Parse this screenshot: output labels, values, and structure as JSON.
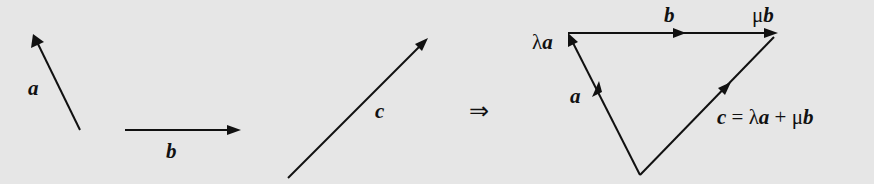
{
  "diagram": {
    "labels": {
      "a": "a",
      "b": "b",
      "c": "c",
      "implies": "⇒",
      "tri_a": "a",
      "tri_b": "b",
      "lambda_a_prefix": "λ",
      "lambda_a_var": "a",
      "mu_b_prefix": "μ",
      "mu_b_var": "b",
      "eq_c": "c",
      "eq_eq": " = λ",
      "eq_a": "a",
      "eq_plus": " + μ",
      "eq_b": "b"
    },
    "vectors": [
      {
        "name": "a",
        "description": "vector a pointing up-left"
      },
      {
        "name": "b",
        "description": "vector b pointing right"
      },
      {
        "name": "c",
        "description": "vector c pointing up-right"
      }
    ],
    "relation": "c = λa + μb"
  }
}
